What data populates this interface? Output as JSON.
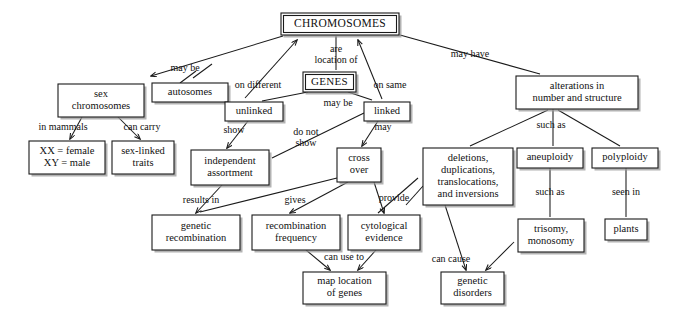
{
  "diagram": {
    "title": "CHROMOSOMES",
    "style": {
      "background": "#ffffff",
      "box_stroke": "#1a1a1a",
      "box_fill": "#ffffff",
      "shadow": "#9a9a9a",
      "text": "#111111"
    },
    "nodes": [
      {
        "id": "chromosomes",
        "lines": [
          "CHROMOSOMES"
        ],
        "x": 281,
        "y": 13,
        "w": 118,
        "h": 22,
        "variant": "root"
      },
      {
        "id": "genes",
        "lines": [
          "GENES"
        ],
        "x": 303,
        "y": 72,
        "w": 53,
        "h": 20,
        "variant": "genes"
      },
      {
        "id": "sex-chromosomes",
        "lines": [
          "sex",
          "chromosomes"
        ],
        "x": 58,
        "y": 84,
        "w": 86,
        "h": 33,
        "variant": "plain"
      },
      {
        "id": "autosomes",
        "lines": [
          "autosomes"
        ],
        "x": 152,
        "y": 83,
        "w": 76,
        "h": 19,
        "variant": "plain"
      },
      {
        "id": "unlinked",
        "lines": [
          "unlinked"
        ],
        "x": 225,
        "y": 102,
        "w": 58,
        "h": 19,
        "variant": "plain"
      },
      {
        "id": "linked",
        "lines": [
          "linked"
        ],
        "x": 364,
        "y": 102,
        "w": 46,
        "h": 19,
        "variant": "plain"
      },
      {
        "id": "alterations",
        "lines": [
          "alterations in",
          "number and structure"
        ],
        "x": 516,
        "y": 76,
        "w": 122,
        "h": 33,
        "variant": "plain"
      },
      {
        "id": "xx-xy",
        "lines": [
          "XX = female",
          "XY = male"
        ],
        "x": 29,
        "y": 141,
        "w": 76,
        "h": 33,
        "variant": "plain"
      },
      {
        "id": "sex-linked-traits",
        "lines": [
          "sex-linked",
          "traits"
        ],
        "x": 112,
        "y": 141,
        "w": 62,
        "h": 33,
        "variant": "plain"
      },
      {
        "id": "independent-assortment",
        "lines": [
          "independent",
          "assortment"
        ],
        "x": 191,
        "y": 150,
        "w": 78,
        "h": 35,
        "variant": "plain"
      },
      {
        "id": "cross-over",
        "lines": [
          "cross",
          "over"
        ],
        "x": 337,
        "y": 148,
        "w": 44,
        "h": 34,
        "variant": "plain"
      },
      {
        "id": "deletions",
        "lines": [
          "deletions,",
          "duplications,",
          "translocations,",
          "and inversions"
        ],
        "x": 423,
        "y": 148,
        "w": 90,
        "h": 57,
        "variant": "plain"
      },
      {
        "id": "aneuploidy",
        "lines": [
          "aneuploidy"
        ],
        "x": 517,
        "y": 148,
        "w": 66,
        "h": 20,
        "variant": "plain"
      },
      {
        "id": "polyploidy",
        "lines": [
          "polyploidy"
        ],
        "x": 592,
        "y": 148,
        "w": 66,
        "h": 20,
        "variant": "plain"
      },
      {
        "id": "genetic-recombination",
        "lines": [
          "genetic",
          "recombination"
        ],
        "x": 152,
        "y": 215,
        "w": 88,
        "h": 35,
        "variant": "plain"
      },
      {
        "id": "recombination-frequency",
        "lines": [
          "recombination",
          "frequency"
        ],
        "x": 252,
        "y": 215,
        "w": 88,
        "h": 35,
        "variant": "plain"
      },
      {
        "id": "cytological-evidence",
        "lines": [
          "cytological",
          "evidence"
        ],
        "x": 348,
        "y": 215,
        "w": 72,
        "h": 35,
        "variant": "plain"
      },
      {
        "id": "trisomy-monosomy",
        "lines": [
          "trisomy,",
          "monosomy"
        ],
        "x": 518,
        "y": 219,
        "w": 66,
        "h": 33,
        "variant": "plain"
      },
      {
        "id": "plants",
        "lines": [
          "plants"
        ],
        "x": 605,
        "y": 219,
        "w": 42,
        "h": 21,
        "variant": "plain"
      },
      {
        "id": "map-location",
        "lines": [
          "map location",
          "of genes"
        ],
        "x": 303,
        "y": 272,
        "w": 83,
        "h": 32,
        "variant": "plain"
      },
      {
        "id": "genetic-disorders",
        "lines": [
          "genetic",
          "disorders"
        ],
        "x": 441,
        "y": 272,
        "w": 63,
        "h": 32,
        "variant": "plain"
      }
    ],
    "links": [
      {
        "id": "may-be-sex",
        "label": "may be",
        "label_x": 185,
        "label_y": 69,
        "points": [
          [
            283,
            36
          ],
          [
            151,
            76
          ]
        ],
        "arrow": "end"
      },
      {
        "id": "may-be-autosomes",
        "label": "",
        "label_x": 0,
        "label_y": 0,
        "points": [
          [
            193,
            78
          ],
          [
            212,
            64
          ]
        ],
        "arrow": "none"
      },
      {
        "id": "autosomes-up",
        "label": "",
        "label_x": 0,
        "label_y": 0,
        "points": [
          [
            180,
            83
          ],
          [
            196,
            71
          ]
        ],
        "arrow": "none"
      },
      {
        "id": "on-different",
        "label": "on different",
        "label_x": 258,
        "label_y": 86,
        "points": [
          [
            245,
            98
          ],
          [
            297,
            40
          ]
        ],
        "arrow": "end"
      },
      {
        "id": "are-location-of",
        "label_lines": [
          "are",
          "location of"
        ],
        "label_x": 336,
        "label_y": 55,
        "points": [
          [
            336,
            36
          ],
          [
            336,
            70
          ]
        ],
        "arrow": "none"
      },
      {
        "id": "on-same",
        "label": "on same",
        "label_x": 390,
        "label_y": 86,
        "points": [
          [
            382,
            99
          ],
          [
            358,
            40
          ]
        ],
        "arrow": "end"
      },
      {
        "id": "may-have",
        "label": "may have",
        "label_x": 470,
        "label_y": 55,
        "points": [
          [
            400,
            35
          ],
          [
            540,
            74
          ]
        ],
        "arrow": "none"
      },
      {
        "id": "genes-unlinked",
        "label": "",
        "label_x": 0,
        "label_y": 0,
        "points": [
          [
            308,
            92
          ],
          [
            262,
            101
          ]
        ],
        "arrow": "none"
      },
      {
        "id": "may-be-linked",
        "label": "may be",
        "label_x": 338,
        "label_y": 104,
        "points": [
          [
            348,
            92
          ],
          [
            372,
            100
          ]
        ],
        "arrow": "none"
      },
      {
        "id": "in-mammals",
        "label": "in mammals",
        "label_x": 63,
        "label_y": 128,
        "points": [
          [
            82,
            117
          ],
          [
            70,
            139
          ]
        ],
        "arrow": "end"
      },
      {
        "id": "can-carry",
        "label": "can carry",
        "label_x": 142,
        "label_y": 128,
        "points": [
          [
            118,
            117
          ],
          [
            140,
            139
          ]
        ],
        "arrow": "end"
      },
      {
        "id": "show",
        "label": "show",
        "label_x": 234,
        "label_y": 131,
        "points": [
          [
            248,
            121
          ],
          [
            227,
            148
          ]
        ],
        "arrow": "end"
      },
      {
        "id": "do-not-show",
        "label_lines": [
          "do not",
          "show"
        ],
        "label_x": 306,
        "label_y": 138,
        "points": [
          [
            364,
            113
          ],
          [
            272,
            158
          ]
        ],
        "arrow": "none"
      },
      {
        "id": "may-cross",
        "label": "may",
        "label_x": 383,
        "label_y": 128,
        "points": [
          [
            378,
            121
          ],
          [
            362,
            146
          ]
        ],
        "arrow": "end"
      },
      {
        "id": "such-as-alterations",
        "label": "such as",
        "label_x": 551,
        "label_y": 126,
        "points": [
          [
            553,
            109
          ],
          [
            553,
            146
          ]
        ],
        "arrow": "none"
      },
      {
        "id": "alterations-deletions",
        "label": "",
        "label_x": 0,
        "label_y": 0,
        "points": [
          [
            548,
            110
          ],
          [
            470,
            146
          ]
        ],
        "arrow": "none"
      },
      {
        "id": "alterations-polyploidy",
        "label": "",
        "label_x": 0,
        "label_y": 0,
        "points": [
          [
            558,
            110
          ],
          [
            620,
            146
          ]
        ],
        "arrow": "none"
      },
      {
        "id": "results-in",
        "label": "results in",
        "label_x": 201,
        "label_y": 201,
        "points": [
          [
            222,
            185
          ],
          [
            196,
            213
          ]
        ],
        "arrow": "end"
      },
      {
        "id": "crossover-genetic-recomb",
        "label": "",
        "label_x": 0,
        "label_y": 0,
        "points": [
          [
            337,
            178
          ],
          [
            200,
            212
          ]
        ],
        "arrow": "none"
      },
      {
        "id": "gives",
        "label": "gives",
        "label_x": 295,
        "label_y": 201,
        "points": [
          [
            348,
            182
          ],
          [
            290,
            213
          ]
        ],
        "arrow": "end"
      },
      {
        "id": "provide",
        "label": "provide",
        "label_x": 394,
        "label_y": 199,
        "points": [
          [
            418,
            178
          ],
          [
            378,
            213
          ]
        ],
        "arrow": "none"
      },
      {
        "id": "crossover-cytological",
        "label": "",
        "label_x": 0,
        "label_y": 0,
        "points": [
          [
            374,
            182
          ],
          [
            384,
            213
          ]
        ],
        "arrow": "end"
      },
      {
        "id": "such-as-aneuploidy",
        "label": "such as",
        "label_x": 550,
        "label_y": 193,
        "points": [
          [
            550,
            168
          ],
          [
            550,
            217
          ]
        ],
        "arrow": "none"
      },
      {
        "id": "seen-in",
        "label": "seen in",
        "label_x": 626,
        "label_y": 193,
        "points": [
          [
            626,
            168
          ],
          [
            626,
            217
          ]
        ],
        "arrow": "none"
      },
      {
        "id": "can-use-to",
        "label": "can use to",
        "label_x": 344,
        "label_y": 258,
        "points": [
          [
            306,
            250
          ],
          [
            330,
            270
          ]
        ],
        "arrow": "end"
      },
      {
        "id": "cytological-map",
        "label": "",
        "label_x": 0,
        "label_y": 0,
        "points": [
          [
            376,
            250
          ],
          [
            358,
            270
          ]
        ],
        "arrow": "end"
      },
      {
        "id": "can-cause",
        "label": "can cause",
        "label_x": 451,
        "label_y": 260,
        "points": [
          [
            445,
            205
          ],
          [
            466,
            270
          ]
        ],
        "arrow": "end"
      },
      {
        "id": "trisomy-disorders",
        "label": "",
        "label_x": 0,
        "label_y": 0,
        "points": [
          [
            514,
            242
          ],
          [
            486,
            270
          ]
        ],
        "arrow": "end"
      },
      {
        "id": "deletions-cytological",
        "label": "",
        "label_x": 0,
        "label_y": 0,
        "points": [
          [
            423,
            186
          ],
          [
            406,
            205
          ]
        ],
        "arrow": "none"
      }
    ]
  }
}
